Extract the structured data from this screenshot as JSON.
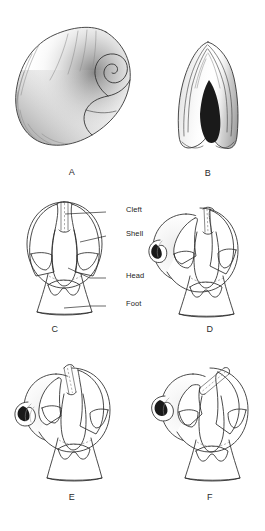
{
  "figure": {
    "background_color": "#ffffff",
    "ink_color": "#2a2a2a",
    "panels": [
      {
        "id": "A",
        "letter": "A",
        "description": "Coiled shell in lateral view with stippled shading and growth lines"
      },
      {
        "id": "B",
        "letter": "B",
        "description": "Shell in apertural (anterior) view showing dark aperture slot"
      },
      {
        "id": "C",
        "letter": "C",
        "description": "Untorted larval body, shell cleft facing forward, head and foot visible"
      },
      {
        "id": "D",
        "letter": "D",
        "description": "Early torsion, shell rotating relative to head-foot"
      },
      {
        "id": "E",
        "letter": "E",
        "description": "Further torsion, shell rotated further over the body"
      },
      {
        "id": "F",
        "letter": "F",
        "description": "Torsion nearly complete, shell coil carried over the head"
      }
    ],
    "callouts": [
      {
        "label": "Cleft",
        "panel": "C"
      },
      {
        "label": "Shell",
        "panel": "C"
      },
      {
        "label": "Head",
        "panel": "C"
      },
      {
        "label": "Foot",
        "panel": "C"
      }
    ]
  }
}
